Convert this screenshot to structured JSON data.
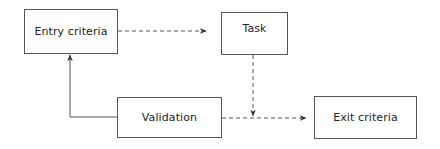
{
  "diagram": {
    "type": "flowchart",
    "nodes": [
      {
        "id": "entry",
        "label": "Entry criteria"
      },
      {
        "id": "task",
        "label": "Task"
      },
      {
        "id": "validation",
        "label": "Validation"
      },
      {
        "id": "exit",
        "label": "Exit criteria"
      }
    ],
    "edges": [
      {
        "from": "entry",
        "to": "task",
        "style": "dashed"
      },
      {
        "from": "task",
        "to": "exit",
        "style": "dashed",
        "via": "merge into validation-exit line"
      },
      {
        "from": "validation",
        "to": "exit",
        "style": "dashed"
      },
      {
        "from": "validation",
        "to": "entry",
        "style": "solid"
      }
    ],
    "colors": {
      "line": "#555555",
      "text": "#222222",
      "background": "#ffffff"
    }
  }
}
